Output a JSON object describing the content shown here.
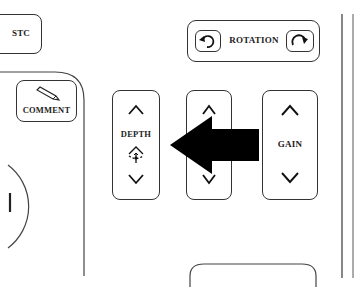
{
  "panel": {
    "stc": {
      "label": "STC"
    },
    "comment": {
      "label": "COMMENT",
      "icon": "pencil-icon"
    },
    "rotation": {
      "label": "ROTATION",
      "left_icon": "rotate-ccw-icon",
      "right_icon": "rotate-cw-icon"
    },
    "depth": {
      "label": "DEPTH",
      "up_icon": "chevron-up-icon",
      "center_icon": "depth-focus-icon",
      "down_icon": "chevron-down-icon"
    },
    "middle": {
      "label": "",
      "up_icon": "chevron-up-icon",
      "down_icon": "chevron-down-icon"
    },
    "gain": {
      "label": "GAIN",
      "up_icon": "chevron-up-icon",
      "down_icon": "chevron-down-icon"
    },
    "callout_arrow": {
      "direction": "left",
      "target": "DEPTH",
      "color": "#000000"
    }
  },
  "colors": {
    "line": "#333333",
    "background": "#ffffff",
    "arrow": "#000000"
  }
}
